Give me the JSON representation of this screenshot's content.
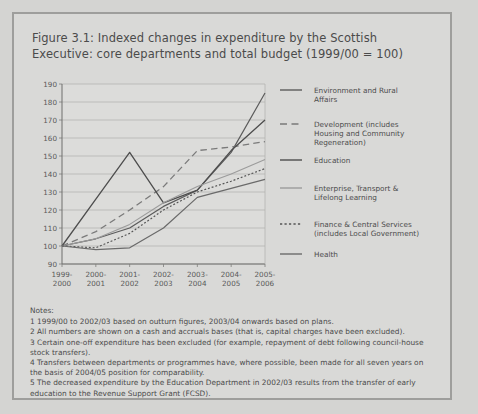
{
  "figure": {
    "title_line1": "Figure 3.1: Indexed changes in expenditure by the Scottish",
    "title_line2": "Executive: core departments and total budget (1999/00 = 100)"
  },
  "notes": {
    "heading": "Notes:",
    "items": [
      "1 1999/00 to 2002/03 based on outturn figures, 2003/04 onwards based on plans.",
      "2 All numbers are shown on a cash and accruals bases (that is, capital charges have been excluded).",
      "3 Certain one-off expenditure has been excluded (for example, repayment of debt following council-house",
      "stock transfers).",
      "4 Transfers between departments or programmes have, where possible, been made for all seven years on",
      "the basis of 2004/05 position for comparability.",
      "5 The decreased expenditure by the Education Department in 2002/03 results from the transfer of early",
      "education to the Revenue Support Grant (FCSD)."
    ]
  },
  "chart_data": {
    "type": "line",
    "title": "Figure 3.1: Indexed changes in expenditure by the Scottish Executive: core departments and total budget (1999/00 = 100)",
    "xlabel": "",
    "ylabel": "",
    "ylim": [
      90,
      190
    ],
    "yticks": [
      90,
      100,
      110,
      120,
      130,
      140,
      150,
      160,
      170,
      180,
      190
    ],
    "grid": true,
    "legend_position": "right",
    "categories": [
      "1999-\n2000",
      "2000-\n2001",
      "2001-\n2002",
      "2002-\n2003",
      "2003-\n2004",
      "2004-\n2005",
      "2005-\n2006"
    ],
    "category_labels_top": [
      "1999-",
      "2000-",
      "2001-",
      "2002-",
      "2003-",
      "2004-",
      "2005-"
    ],
    "category_labels_bottom": [
      "2000",
      "2001",
      "2002",
      "2003",
      "2004",
      "2005",
      "2006"
    ],
    "series": [
      {
        "name": "Environment and Rural Affairs",
        "style": "solid",
        "color": "#5b5b5b",
        "width": 1.2,
        "values": [
          100,
          104,
          110,
          122,
          131,
          152,
          185
        ]
      },
      {
        "name": "Development (includes Housing and Community Regeneration)",
        "style": "longdash",
        "color": "#7a7a7a",
        "width": 1.3,
        "values": [
          100,
          108,
          120,
          133,
          153,
          155,
          158
        ]
      },
      {
        "name": "Education",
        "style": "solid",
        "color": "#4d4d4d",
        "width": 1.3,
        "values": [
          100,
          126,
          152,
          124,
          131,
          153,
          170
        ]
      },
      {
        "name": "Enterprise, Transport & Lifelong Learning",
        "style": "solid",
        "color": "#9b9b9b",
        "width": 1.1,
        "values": [
          100,
          104,
          112,
          124,
          133,
          140,
          148
        ]
      },
      {
        "name": "Finance & Central Services (includes Local Government)",
        "style": "dotted",
        "color": "#555555",
        "width": 1.2,
        "values": [
          100,
          99,
          107,
          120,
          130,
          136,
          143
        ]
      },
      {
        "name": "Health",
        "style": "solid",
        "color": "#6a6a6a",
        "width": 1.2,
        "values": [
          100,
          98,
          99,
          110,
          127,
          132,
          137
        ]
      }
    ],
    "legend_entries": [
      {
        "label_lines": [
          "Environment and Rural",
          "Affairs"
        ],
        "style": "solid",
        "color": "#5b5b5b"
      },
      {
        "label_lines": [
          "Development (includes",
          "Housing and Community",
          "Regeneration)"
        ],
        "style": "longdash",
        "color": "#7a7a7a"
      },
      {
        "label_lines": [
          "Education"
        ],
        "style": "solid",
        "color": "#4d4d4d"
      },
      {
        "label_lines": [
          "Enterprise, Transport &",
          "Lifelong Learning"
        ],
        "style": "solid",
        "color": "#9b9b9b"
      },
      {
        "label_lines": [
          "Finance & Central Services",
          "(includes Local Government)"
        ],
        "style": "dotted",
        "color": "#555555"
      },
      {
        "label_lines": [
          "Health"
        ],
        "style": "solid",
        "color": "#6a6a6a"
      }
    ]
  }
}
